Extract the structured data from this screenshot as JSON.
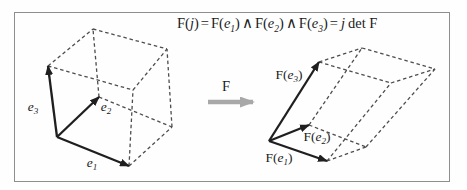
{
  "figure": {
    "kind": "linear-map-determinant-diagram",
    "colors": {
      "frame_border": "#8e8e8e",
      "vector_stroke": "#1f1f1f",
      "dashed_stroke": "#4d4d4d",
      "transform_arrow": "#a8a8a8",
      "text": "#1b1b1b",
      "background": "#fefefe"
    },
    "formula": {
      "parts": [
        "F(",
        "j",
        ")",
        "=",
        "F(",
        "e",
        "1",
        ")",
        "∧",
        "F(",
        "e",
        "2",
        ")",
        "∧",
        "F(",
        "e",
        "3",
        ")",
        "=",
        "j",
        "det F"
      ]
    },
    "transform": {
      "label": "F"
    },
    "labels": {
      "e1": {
        "base": "e",
        "sub": "1"
      },
      "e2": {
        "base": "e",
        "sub": "2"
      },
      "e3": {
        "base": "e",
        "sub": "3"
      },
      "Fe1": {
        "pre": "F(",
        "base": "e",
        "sub": "1",
        "post": ")"
      },
      "Fe2": {
        "pre": "F(",
        "base": "e",
        "sub": "2",
        "post": ")"
      },
      "Fe3": {
        "pre": "F(",
        "base": "e",
        "sub": "3",
        "post": ")"
      }
    },
    "solids": [
      {
        "name": "basis-cube",
        "vertices": {
          "A": [
            57,
            137
          ],
          "B": [
            129,
            166
          ],
          "C": [
            99,
            97
          ],
          "D": [
            48,
            66
          ],
          "E": [
            172,
            127
          ],
          "F": [
            133,
            90
          ],
          "G": [
            93,
            29
          ],
          "H": [
            167,
            49
          ]
        },
        "dashed_edges": [
          [
            "D",
            "F"
          ],
          [
            "D",
            "G"
          ],
          [
            "G",
            "H"
          ],
          [
            "F",
            "H"
          ],
          [
            "C",
            "G"
          ],
          [
            "C",
            "E"
          ],
          [
            "E",
            "H"
          ],
          [
            "B",
            "E"
          ],
          [
            "B",
            "F"
          ]
        ],
        "vector_arrows": [
          {
            "name": "e1-vector",
            "from": "A",
            "to": "B"
          },
          {
            "name": "e2-vector",
            "from": "A",
            "to": "C"
          },
          {
            "name": "e3-vector",
            "from": "A",
            "to": "D"
          }
        ]
      },
      {
        "name": "image-parallelepiped",
        "vertices": {
          "A": [
            269,
            141
          ],
          "B": [
            327,
            161
          ],
          "C": [
            309,
            125
          ],
          "D": [
            319,
            62
          ],
          "E": [
            366,
            147
          ],
          "F": [
            391,
            83
          ],
          "G": [
            362,
            48
          ],
          "H": [
            435,
            69
          ]
        },
        "dashed_edges": [
          [
            "D",
            "F"
          ],
          [
            "D",
            "G"
          ],
          [
            "G",
            "H"
          ],
          [
            "F",
            "H"
          ],
          [
            "C",
            "G"
          ],
          [
            "C",
            "E"
          ],
          [
            "E",
            "H"
          ],
          [
            "B",
            "E"
          ],
          [
            "B",
            "F"
          ]
        ],
        "vector_arrows": [
          {
            "name": "Fe1-vector",
            "from": "A",
            "to": "B"
          },
          {
            "name": "Fe2-vector",
            "from": "A",
            "to": "C"
          },
          {
            "name": "Fe3-vector",
            "from": "A",
            "to": "D"
          }
        ]
      }
    ],
    "transform_arrow_geometry": {
      "x1": 208,
      "y1": 102,
      "x2": 253,
      "y2": 102
    }
  }
}
